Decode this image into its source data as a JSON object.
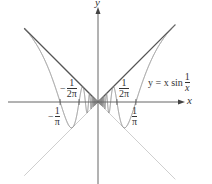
{
  "chart_data": {
    "type": "line",
    "title": "",
    "xlabel": "x",
    "ylabel": "y",
    "function_label": "y = x sin 1/x",
    "series": [
      {
        "name": "y = x sin(1/x)",
        "expr": "x*sin(1/x)",
        "color": "#8a8a8a",
        "style": "solid"
      },
      {
        "name": "y = |x|",
        "expr": "abs(x)",
        "color": "#555555",
        "style": "solid"
      },
      {
        "name": "y = -|x|",
        "expr": "-abs(x)",
        "color": "#cfcfcf",
        "style": "solid"
      }
    ],
    "tick_labels": [
      "-1/π",
      "-1/(2π)",
      "1/(2π)",
      "1/π"
    ],
    "xlim": [
      -0.62,
      0.72
    ],
    "ylim": [
      -0.69,
      0.79
    ],
    "grid": false,
    "legend": "none"
  },
  "labels": {
    "x_axis": "x",
    "y_axis": "y",
    "func_prefix": "y = x sin",
    "func_num": "1",
    "func_den": "x",
    "tick_neg_1_pi": {
      "sign": "−",
      "num": "1",
      "den": "π"
    },
    "tick_neg_1_2pi": {
      "sign": "−",
      "num": "1",
      "den": "2π"
    },
    "tick_pos_1_2pi": {
      "num": "1",
      "den": "2π"
    },
    "tick_pos_1_pi": {
      "num": "1",
      "den": "π"
    }
  },
  "colors": {
    "axis": "#666666",
    "curve": "#8a8a8a",
    "upper_envelope": "#555555",
    "lower_envelope": "#cfcfcf"
  }
}
